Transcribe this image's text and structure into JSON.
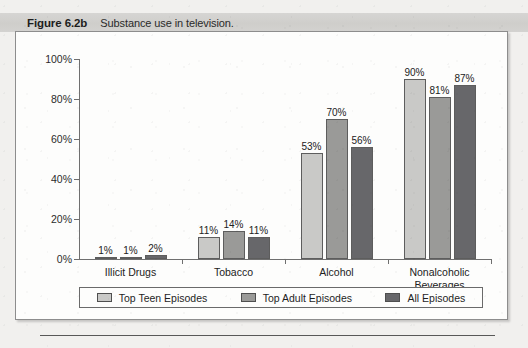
{
  "caption": {
    "figure_number": "Figure 6.2b",
    "text": "Substance use in television."
  },
  "chart_data": {
    "type": "bar",
    "title": "Substance use in television.",
    "xlabel": "",
    "ylabel": "",
    "ylim": [
      0,
      100
    ],
    "yticks": [
      "0%",
      "20%",
      "40%",
      "60%",
      "80%",
      "100%"
    ],
    "grid": false,
    "legend_position": "bottom",
    "value_suffix": "%",
    "categories": [
      "Illicit Drugs",
      "Tobacco",
      "Alcohol",
      "Nonalcoholic Beverages"
    ],
    "series": [
      {
        "name": "Top Teen Episodes",
        "color": "#c9c9c7",
        "values": [
          1,
          11,
          53,
          90
        ],
        "labels": [
          "1%",
          "11%",
          "53%",
          "90%"
        ]
      },
      {
        "name": "Top Adult Episodes",
        "color": "#9a9a98",
        "values": [
          1,
          14,
          70,
          81
        ],
        "labels": [
          "1%",
          "14%",
          "70%",
          "81%"
        ]
      },
      {
        "name": "All Episodes",
        "color": "#67676a",
        "values": [
          2,
          11,
          56,
          87
        ],
        "labels": [
          "2%",
          "11%",
          "56%",
          "87%"
        ]
      }
    ]
  }
}
